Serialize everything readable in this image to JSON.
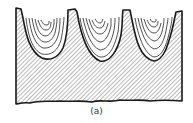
{
  "figure": {
    "caption": "(a)",
    "pocket_count": 3,
    "colors": {
      "line": "#1a1a1a",
      "hatch": "#555555",
      "background": "#ffffff"
    }
  }
}
